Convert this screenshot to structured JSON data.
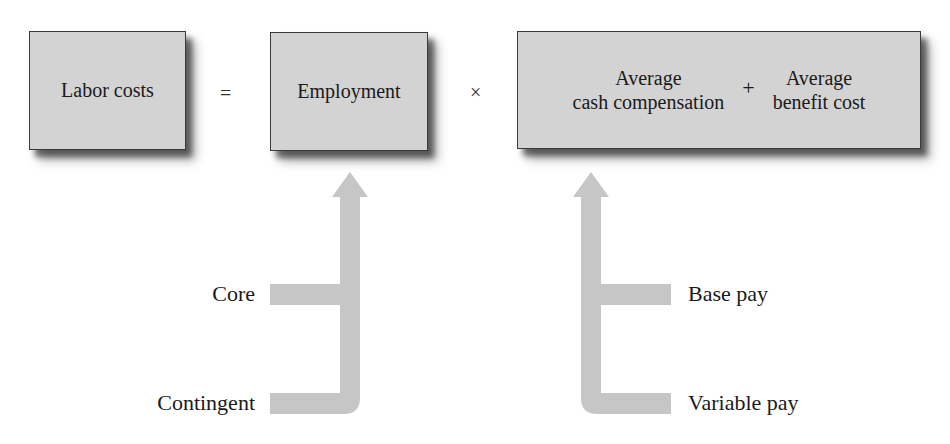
{
  "equation": {
    "result": "Labor costs",
    "equals": "=",
    "factor1": "Employment",
    "times": "×",
    "factor2": {
      "left": {
        "line1": "Average",
        "line2": "cash compensation"
      },
      "plus": "+",
      "right": {
        "line1": "Average",
        "line2": "benefit cost"
      }
    }
  },
  "employment_inputs": [
    "Core",
    "Contingent"
  ],
  "compensation_inputs": [
    "Base pay",
    "Variable pay"
  ],
  "colors": {
    "box_fill": "#d3d3d3",
    "box_border": "#3a3a3a",
    "arrow": "#c6c6c6"
  }
}
